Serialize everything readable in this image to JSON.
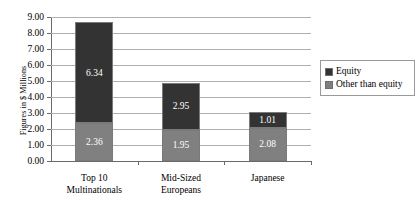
{
  "chart_data": {
    "type": "bar",
    "subtype": "stacked-bar",
    "title": "",
    "xlabel": "",
    "ylabel": "Figures in $ Millions",
    "ylim": [
      0,
      9
    ],
    "ytick_step": 1,
    "grid": true,
    "legend_position": "right",
    "categories": [
      {
        "line1": "Top 10",
        "line2": "Multinationals"
      },
      {
        "line1": "Mid-Sized",
        "line2": "Europeans"
      },
      {
        "line1": "Japanese",
        "line2": ""
      }
    ],
    "ytick_labels": [
      "9.00",
      "8.00",
      "7.00",
      "6.00",
      "5.00",
      "4.00",
      "3.00",
      "2.00",
      "1.00",
      "0.00"
    ],
    "series": [
      {
        "name": "Equity",
        "color": "#333333",
        "label_color": "#ffffff",
        "values": [
          6.34,
          2.95,
          1.01
        ],
        "value_labels": [
          "6.34",
          "2.95",
          "1.01"
        ]
      },
      {
        "name": "Other than equity",
        "color": "#808080",
        "label_color": "#ffffff",
        "values": [
          2.36,
          1.95,
          2.08
        ],
        "value_labels": [
          "2.36",
          "1.95",
          "2.08"
        ]
      }
    ],
    "totals": [
      8.7,
      4.9,
      3.09
    ]
  },
  "legend": {
    "entries": [
      {
        "label": "Equity",
        "color": "#333333"
      },
      {
        "label": "Other than equity",
        "color": "#808080"
      }
    ]
  },
  "axis": {
    "y_title": "Figures in $ Millions"
  }
}
